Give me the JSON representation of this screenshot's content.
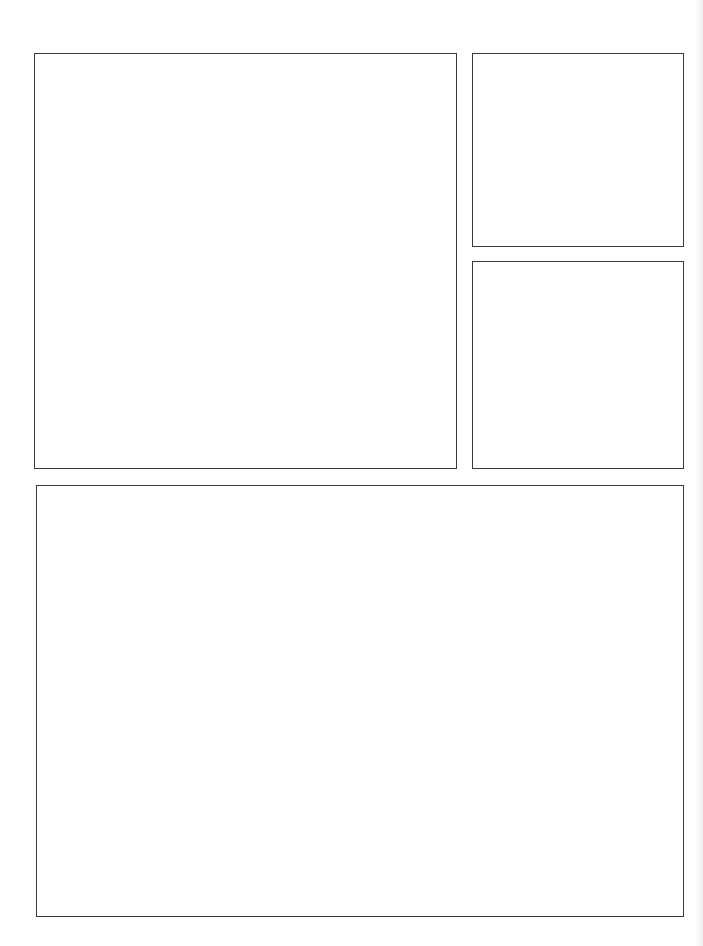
{
  "page": {
    "type": "blank comic page template",
    "background": "#ffffff",
    "border_color": "#3a3a3a",
    "panels": [
      {
        "id": "panel-1",
        "position": "top-left large",
        "content": ""
      },
      {
        "id": "panel-2",
        "position": "top-right upper",
        "content": ""
      },
      {
        "id": "panel-3",
        "position": "top-right lower",
        "content": ""
      },
      {
        "id": "panel-4",
        "position": "bottom wide",
        "content": ""
      }
    ]
  }
}
